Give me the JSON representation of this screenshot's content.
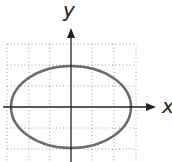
{
  "diagram": {
    "type": "ellipse-on-grid",
    "x_axis_label": "x",
    "y_axis_label": "y",
    "grid": {
      "x_lines": [
        7,
        29,
        50,
        92,
        114,
        136
      ],
      "y_lines": [
        44,
        65,
        86,
        128,
        149
      ],
      "x_min": 7,
      "x_max": 136,
      "y_min": 44,
      "y_max": 162
    },
    "origin": {
      "x": 71,
      "y": 107
    },
    "ellipse": {
      "cx": 71,
      "cy": 107,
      "rx": 60,
      "ry": 41
    },
    "colors": {
      "ellipse": "#6b6b6b",
      "axis": "#222222",
      "grid": "#9a9a9a"
    }
  }
}
